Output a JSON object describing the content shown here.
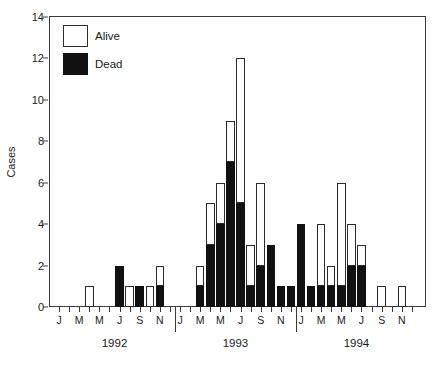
{
  "chart_data": {
    "type": "bar",
    "stacked": true,
    "title": "",
    "xlabel": "",
    "ylabel": "Cases",
    "ylim": [
      0,
      14
    ],
    "yticks": [
      0,
      2,
      4,
      6,
      8,
      10,
      12,
      14
    ],
    "grid": false,
    "legend_position": "top-left",
    "series": [
      {
        "name": "Alive",
        "color": "#ffffff"
      },
      {
        "name": "Dead",
        "color": "#111111"
      }
    ],
    "years": [
      "1992",
      "1993",
      "1994"
    ],
    "month_labels": [
      "J",
      "M",
      "M",
      "J",
      "S",
      "N"
    ],
    "categories": [
      "1992-J",
      "1992-F",
      "1992-M",
      "1992-A",
      "1992-M",
      "1992-J",
      "1992-J",
      "1992-A",
      "1992-S",
      "1992-O",
      "1992-N",
      "1992-D",
      "1993-J",
      "1993-F",
      "1993-M",
      "1993-A",
      "1993-M",
      "1993-J",
      "1993-J",
      "1993-A",
      "1993-S",
      "1993-O",
      "1993-N",
      "1993-D",
      "1994-J",
      "1994-F",
      "1994-M",
      "1994-A",
      "1994-M",
      "1994-J",
      "1994-J",
      "1994-A",
      "1994-S",
      "1994-O",
      "1994-N",
      "1994-D"
    ],
    "bars": [
      {
        "category": "1992-J",
        "dead": 0,
        "alive": 0,
        "total": 0
      },
      {
        "category": "1992-F",
        "dead": 0,
        "alive": 0,
        "total": 0
      },
      {
        "category": "1992-M",
        "dead": 0,
        "alive": 0,
        "total": 0
      },
      {
        "category": "1992-A",
        "dead": 0,
        "alive": 1,
        "total": 1
      },
      {
        "category": "1992-M",
        "dead": 0,
        "alive": 0,
        "total": 0
      },
      {
        "category": "1992-J",
        "dead": 0,
        "alive": 0,
        "total": 0
      },
      {
        "category": "1992-J",
        "dead": 2,
        "alive": 0,
        "total": 2
      },
      {
        "category": "1992-A",
        "dead": 0,
        "alive": 1,
        "total": 1
      },
      {
        "category": "1992-S",
        "dead": 1,
        "alive": 0,
        "total": 1
      },
      {
        "category": "1992-O",
        "dead": 0,
        "alive": 1,
        "total": 1
      },
      {
        "category": "1992-N",
        "dead": 1,
        "alive": 1,
        "total": 2
      },
      {
        "category": "1992-D",
        "dead": 0,
        "alive": 0,
        "total": 0
      },
      {
        "category": "1993-J",
        "dead": 0,
        "alive": 0,
        "total": 0
      },
      {
        "category": "1993-F",
        "dead": 0,
        "alive": 0,
        "total": 0
      },
      {
        "category": "1993-M",
        "dead": 1,
        "alive": 1,
        "total": 2
      },
      {
        "category": "1993-A",
        "dead": 3,
        "alive": 2,
        "total": 5
      },
      {
        "category": "1993-M",
        "dead": 4,
        "alive": 2,
        "total": 6
      },
      {
        "category": "1993-J",
        "dead": 7,
        "alive": 2,
        "total": 9
      },
      {
        "category": "1993-J",
        "dead": 5,
        "alive": 7,
        "total": 12
      },
      {
        "category": "1993-A",
        "dead": 1,
        "alive": 2,
        "total": 3
      },
      {
        "category": "1993-S",
        "dead": 2,
        "alive": 4,
        "total": 6
      },
      {
        "category": "1993-O",
        "dead": 3,
        "alive": 0,
        "total": 3
      },
      {
        "category": "1993-N",
        "dead": 1,
        "alive": 0,
        "total": 1
      },
      {
        "category": "1993-D",
        "dead": 1,
        "alive": 0,
        "total": 1
      },
      {
        "category": "1994-J",
        "dead": 4,
        "alive": 0,
        "total": 4
      },
      {
        "category": "1994-F",
        "dead": 1,
        "alive": 0,
        "total": 1
      },
      {
        "category": "1994-M",
        "dead": 1,
        "alive": 3,
        "total": 4
      },
      {
        "category": "1994-A",
        "dead": 1,
        "alive": 1,
        "total": 2
      },
      {
        "category": "1994-M",
        "dead": 1,
        "alive": 5,
        "total": 6
      },
      {
        "category": "1994-J",
        "dead": 2,
        "alive": 2,
        "total": 4
      },
      {
        "category": "1994-J",
        "dead": 2,
        "alive": 1,
        "total": 3
      },
      {
        "category": "1994-A",
        "dead": 0,
        "alive": 0,
        "total": 0
      },
      {
        "category": "1994-S",
        "dead": 0,
        "alive": 1,
        "total": 1
      },
      {
        "category": "1994-O",
        "dead": 0,
        "alive": 0,
        "total": 0
      },
      {
        "category": "1994-N",
        "dead": 0,
        "alive": 1,
        "total": 1
      },
      {
        "category": "1994-D",
        "dead": 0,
        "alive": 0,
        "total": 0
      }
    ]
  },
  "legend": {
    "alive_label": "Alive",
    "dead_label": "Dead"
  },
  "axes": {
    "y_title": "Cases",
    "y_ticks": [
      "0",
      "2",
      "4",
      "6",
      "8",
      "10",
      "12",
      "14"
    ],
    "month_labels": [
      "J",
      "M",
      "M",
      "J",
      "S",
      "N"
    ],
    "year_labels": [
      "1992",
      "1993",
      "1994"
    ]
  }
}
